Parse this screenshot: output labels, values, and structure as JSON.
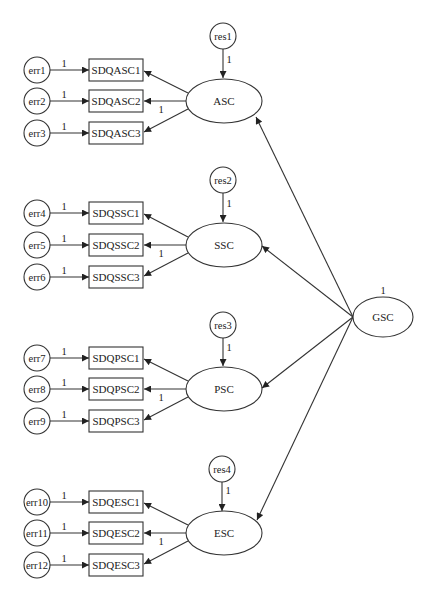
{
  "diagram": {
    "kind": "second-order confirmatory factor analysis path diagram",
    "second_order_factor": {
      "label": "GSC",
      "variance_label": "1"
    },
    "factors": [
      {
        "label": "ASC",
        "residual": {
          "label": "res1",
          "path_label": "1"
        },
        "fixed_loading_label": "1",
        "indicators": [
          {
            "label": "SDQASC1",
            "error": "err1",
            "error_path_label": "1"
          },
          {
            "label": "SDQASC2",
            "error": "err2",
            "error_path_label": "1"
          },
          {
            "label": "SDQASC3",
            "error": "err3",
            "error_path_label": "1"
          }
        ]
      },
      {
        "label": "SSC",
        "residual": {
          "label": "res2",
          "path_label": "1"
        },
        "fixed_loading_label": "1",
        "indicators": [
          {
            "label": "SDQSSC1",
            "error": "err4",
            "error_path_label": "1"
          },
          {
            "label": "SDQSSC2",
            "error": "err5",
            "error_path_label": "1"
          },
          {
            "label": "SDQSSC3",
            "error": "err6",
            "error_path_label": "1"
          }
        ]
      },
      {
        "label": "PSC",
        "residual": {
          "label": "res3",
          "path_label": "1"
        },
        "fixed_loading_label": "1",
        "indicators": [
          {
            "label": "SDQPSC1",
            "error": "err7",
            "error_path_label": "1"
          },
          {
            "label": "SDQPSC2",
            "error": "err8",
            "error_path_label": "1"
          },
          {
            "label": "SDQPSC3",
            "error": "err9",
            "error_path_label": "1"
          }
        ]
      },
      {
        "label": "ESC",
        "residual": {
          "label": "res4",
          "path_label": "1"
        },
        "fixed_loading_label": "1",
        "indicators": [
          {
            "label": "SDQESC1",
            "error": "err10",
            "error_path_label": "1"
          },
          {
            "label": "SDQESC2",
            "error": "err11",
            "error_path_label": "1"
          },
          {
            "label": "SDQESC3",
            "error": "err12",
            "error_path_label": "1"
          }
        ]
      }
    ],
    "colors": {
      "stroke": "#333333",
      "text": "#222222",
      "background": "#ffffff"
    }
  }
}
